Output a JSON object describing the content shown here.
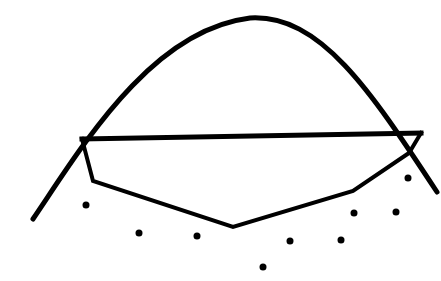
{
  "diagram": {
    "width": 441,
    "height": 281,
    "background": "#ffffff",
    "stroke_color": "#000000",
    "curve": {
      "label": "bell curve",
      "stroke_width": 5,
      "start": [
        33,
        219
      ],
      "peak": [
        258,
        18
      ],
      "end": [
        437,
        192
      ],
      "path": "M 33 219 C 80 150, 150 30, 250 18 C 320 14, 370 90, 437 192"
    },
    "top_line": {
      "label": "horizontal chord",
      "stroke_width": 5,
      "left": [
        82,
        139
      ],
      "right": [
        421,
        133
      ]
    },
    "polygon": {
      "label": "lower hull polyline",
      "stroke_width": 4,
      "points": [
        [
          82,
          139
        ],
        [
          93,
          181
        ],
        [
          233,
          227
        ],
        [
          353,
          191
        ],
        [
          409,
          153
        ],
        [
          421,
          133
        ]
      ]
    },
    "dots": {
      "label": "scattered points",
      "radius": 3.5,
      "points": [
        [
          86,
          205
        ],
        [
          139,
          233
        ],
        [
          197,
          236
        ],
        [
          263,
          267
        ],
        [
          290,
          241
        ],
        [
          341,
          240
        ],
        [
          354,
          213
        ],
        [
          396,
          212
        ],
        [
          408,
          178
        ]
      ]
    }
  }
}
